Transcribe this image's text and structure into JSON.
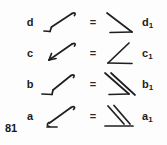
{
  "page": {
    "page_number": "81",
    "background_color": "#fdfdfd",
    "ink_color": "#1c1c1c",
    "equals_symbol": "="
  },
  "rows": [
    {
      "left_label": "d",
      "right_label": "d",
      "right_subscript": "1",
      "equals": "=",
      "left_glyph_name": "arrow-up-right-with-start-hook",
      "right_glyph_name": "angle-open-left-down-right-diagonal"
    },
    {
      "left_label": "c",
      "right_label": "c",
      "right_subscript": "1",
      "equals": "=",
      "left_glyph_name": "arrow-down-left-with-arrowhead",
      "right_glyph_name": "angle-open-right-upper-diagonal"
    },
    {
      "left_label": "b",
      "right_label": "b",
      "right_subscript": "1",
      "equals": "=",
      "left_glyph_name": "arrow-up-right-with-horizontal-tail",
      "right_glyph_name": "double-diagonal-angle-open-left"
    },
    {
      "left_label": "a",
      "right_label": "a",
      "right_subscript": "1",
      "equals": "=",
      "left_glyph_name": "arrow-up-right-with-short-tail",
      "right_glyph_name": "double-diagonal-angle-with-baseline"
    }
  ]
}
